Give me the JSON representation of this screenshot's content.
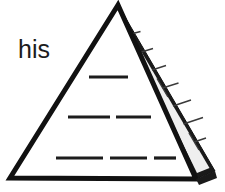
{
  "figure": {
    "name": "pyramid-line-drawing",
    "background_color": "#ffffff",
    "outline_color": "#111111",
    "block_fill_color": "#efefef",
    "block_line_color": "#3a3a3a",
    "dash_color": "#1c1c1c",
    "text_color": "#1c1c1c"
  },
  "annotation": {
    "word": "his",
    "font_size_px": 25,
    "x": 18,
    "y": 58
  },
  "geometry": {
    "apex": {
      "x": 118,
      "y": 5
    },
    "bottom_left": {
      "x": 10,
      "y": 178
    },
    "front_bottom_right": {
      "x": 196,
      "y": 179
    },
    "right_back_bottom": {
      "x": 215,
      "y": 171
    },
    "front_face_label": "front-face",
    "right_face_label": "right-face",
    "right_face_block_rows": 8
  },
  "right_face_blocks": [
    {
      "row": 1,
      "split": false
    },
    {
      "row": 2,
      "split": true
    },
    {
      "row": 3,
      "split": false
    },
    {
      "row": 4,
      "split": false
    },
    {
      "row": 5,
      "split": true
    },
    {
      "row": 6,
      "split": false
    },
    {
      "row": 7,
      "split": false
    },
    {
      "row": 8,
      "split": true
    }
  ],
  "dash_rows": [
    {
      "row": 1,
      "y": 77,
      "count": 1,
      "segments": [
        {
          "x1": 89,
          "x2": 128
        }
      ]
    },
    {
      "row": 2,
      "y": 117,
      "count": 2,
      "segments": [
        {
          "x1": 68,
          "x2": 110
        },
        {
          "x1": 116,
          "x2": 151
        }
      ]
    },
    {
      "row": 3,
      "y": 158,
      "count": 3,
      "segments": [
        {
          "x1": 56,
          "x2": 103
        },
        {
          "x1": 110,
          "x2": 147
        },
        {
          "x1": 154,
          "x2": 176
        }
      ]
    }
  ]
}
